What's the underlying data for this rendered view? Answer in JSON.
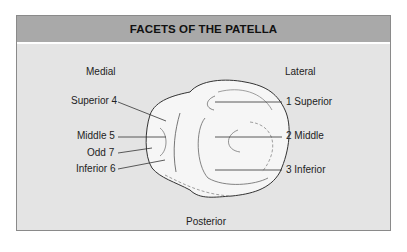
{
  "title": "FACETS OF THE PATELLA",
  "orientation": {
    "medial": "Medial",
    "lateral": "Lateral",
    "posterior": "Posterior"
  },
  "medial_facets": [
    {
      "label": "Superior 4"
    },
    {
      "label": "Middle 5"
    },
    {
      "label": "Odd 7"
    },
    {
      "label": "Inferior 6"
    }
  ],
  "lateral_facets": [
    {
      "label": "1 Superior"
    },
    {
      "label": "2 Middle"
    },
    {
      "label": "3 Inferior"
    }
  ],
  "colors": {
    "header_bg": "#a9a9a9",
    "body_bg": "#e4e4e4",
    "line": "#333333"
  }
}
